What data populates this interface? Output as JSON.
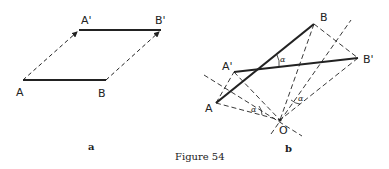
{
  "figure": {
    "caption": "Figure 54",
    "panels": [
      {
        "id": "a",
        "label": "a",
        "points": {
          "A": "A",
          "B": "B",
          "A_prime": "A'",
          "B_prime": "B'"
        }
      },
      {
        "id": "b",
        "label": "b",
        "points": {
          "A": "A",
          "B": "B",
          "A_prime": "A'",
          "B_prime": "B'",
          "O": "O"
        },
        "angle_label": "α"
      }
    ]
  },
  "colors": {
    "ink": "#222222",
    "background": "#ffffff"
  }
}
